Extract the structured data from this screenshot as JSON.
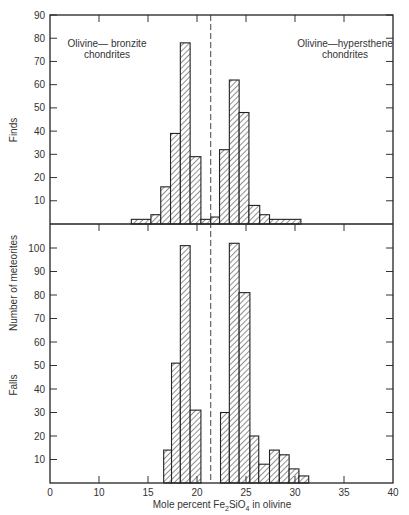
{
  "chart_data": {
    "type": "bar",
    "subtype": "histogram",
    "xlabel": "Mole percent Fe2SiO4 in olivine",
    "xlabel_parts": {
      "pre": "Mole percent Fe",
      "sub1": "2",
      "mid": "SiO",
      "sub2": "4",
      "post": " in olivine"
    },
    "ylabel": "Number of meteorites",
    "x_tick_labels": [
      "0",
      "10",
      "15",
      "20",
      "25",
      "30",
      "35",
      "40"
    ],
    "x_axis_note": "broken axis between 0 and 10",
    "divider_x": 21.4,
    "grid": false,
    "panels": [
      {
        "name": "Finds",
        "ylim": [
          0,
          90
        ],
        "y_ticks": [
          10,
          20,
          30,
          40,
          50,
          60,
          70,
          80,
          90
        ],
        "annotations": [
          {
            "text": [
              "Olivine— bronzite",
              "chondrites"
            ],
            "x": 13.2,
            "y": 80
          },
          {
            "text": [
              "Olivine—hypersthene",
              "chondrites"
            ],
            "x": 26.5,
            "y": 80
          }
        ],
        "bins": [
          {
            "x0": 13.3,
            "x1": 15.3,
            "count": 2
          },
          {
            "x0": 15.3,
            "x1": 16.3,
            "count": 4
          },
          {
            "x0": 16.3,
            "x1": 17.3,
            "count": 16
          },
          {
            "x0": 17.3,
            "x1": 18.3,
            "count": 39
          },
          {
            "x0": 18.3,
            "x1": 19.3,
            "count": 78
          },
          {
            "x0": 19.3,
            "x1": 20.4,
            "count": 29
          },
          {
            "x0": 20.4,
            "x1": 21.4,
            "count": 2
          },
          {
            "x0": 21.4,
            "x1": 22.3,
            "count": 3
          },
          {
            "x0": 22.3,
            "x1": 23.3,
            "count": 32
          },
          {
            "x0": 23.3,
            "x1": 24.3,
            "count": 62
          },
          {
            "x0": 24.3,
            "x1": 25.3,
            "count": 48
          },
          {
            "x0": 25.3,
            "x1": 26.4,
            "count": 8
          },
          {
            "x0": 26.4,
            "x1": 27.4,
            "count": 4
          },
          {
            "x0": 27.4,
            "x1": 30.6,
            "count": 2
          }
        ]
      },
      {
        "name": "Falls",
        "ylim": [
          0,
          110
        ],
        "y_ticks": [
          10,
          20,
          30,
          40,
          50,
          60,
          70,
          80,
          90,
          100
        ],
        "bins": [
          {
            "x0": 16.6,
            "x1": 17.4,
            "count": 14
          },
          {
            "x0": 17.4,
            "x1": 18.3,
            "count": 51
          },
          {
            "x0": 18.3,
            "x1": 19.3,
            "count": 101
          },
          {
            "x0": 19.3,
            "x1": 20.4,
            "count": 31
          },
          {
            "x0": 22.4,
            "x1": 23.3,
            "count": 30
          },
          {
            "x0": 23.3,
            "x1": 24.3,
            "count": 102
          },
          {
            "x0": 24.3,
            "x1": 25.4,
            "count": 81
          },
          {
            "x0": 25.4,
            "x1": 26.3,
            "count": 20
          },
          {
            "x0": 26.3,
            "x1": 27.4,
            "count": 8
          },
          {
            "x0": 27.4,
            "x1": 28.4,
            "count": 14
          },
          {
            "x0": 28.4,
            "x1": 29.4,
            "count": 12
          },
          {
            "x0": 29.4,
            "x1": 30.4,
            "count": 6
          },
          {
            "x0": 30.4,
            "x1": 31.4,
            "count": 3
          }
        ]
      }
    ]
  }
}
